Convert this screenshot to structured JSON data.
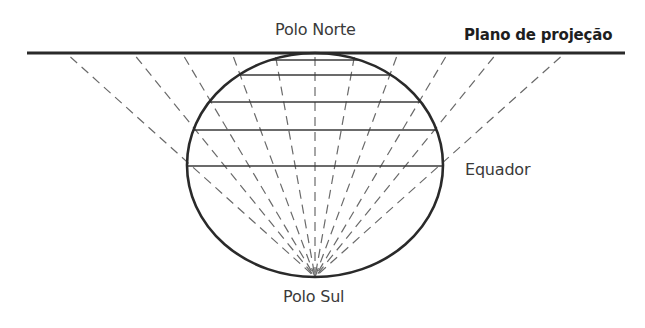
{
  "labels": {
    "north_pole": "Polo Norte",
    "south_pole": "Polo Sul",
    "equator": "Equador",
    "projection_plane": "Plano de projeção"
  },
  "geometry": {
    "plane": {
      "y": 53,
      "x1": 27,
      "x2": 625
    },
    "globe": {
      "cx": 315,
      "cy": 165,
      "rx": 128,
      "ry": 112
    },
    "south_pole_point": {
      "x": 315,
      "y": 277
    },
    "parallels_y": [
      60,
      75,
      102,
      130,
      166
    ],
    "projection_rays_top_x": [
      66,
      133,
      182,
      232,
      275,
      315,
      355,
      398,
      448,
      497,
      565
    ]
  },
  "colors": {
    "line": "#2a2a2a",
    "dash": "#6a6a6a",
    "text": "#3a3a3a"
  }
}
